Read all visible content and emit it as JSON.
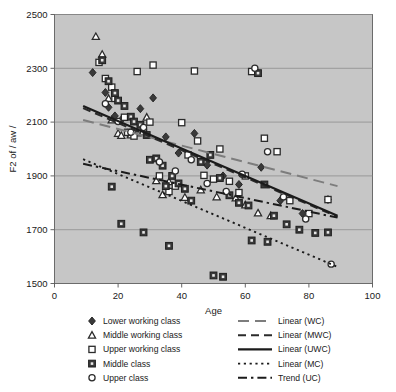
{
  "chart_data": {
    "type": "scatter",
    "title": "",
    "xlabel": "Age",
    "ylabel": "F2 of / aw /",
    "xlim": [
      0,
      100
    ],
    "ylim": [
      1500,
      2500
    ],
    "xticks": [
      0,
      20,
      40,
      60,
      80,
      100
    ],
    "yticks": [
      1500,
      1700,
      1900,
      2100,
      2300,
      2500
    ],
    "grid": "horizontal",
    "plot_background": "#c6c6c6",
    "legend_position": "below-axes",
    "series": [
      {
        "name": "Lower working class",
        "marker": "diamond",
        "points": [
          [
            12,
            2284
          ],
          [
            16,
            2210
          ],
          [
            17,
            2155
          ],
          [
            19,
            2123
          ],
          [
            21,
            2108
          ],
          [
            23,
            2060
          ],
          [
            27,
            2150
          ],
          [
            31,
            2190
          ],
          [
            35,
            2045
          ],
          [
            39,
            1985
          ],
          [
            44,
            2058
          ],
          [
            48,
            1940
          ],
          [
            53,
            1900
          ],
          [
            58,
            1868
          ],
          [
            63,
            2295
          ],
          [
            65,
            1932
          ],
          [
            71,
            1808
          ],
          [
            78,
            1760
          ],
          [
            86,
            1812
          ]
        ]
      },
      {
        "name": "Middle working class",
        "marker": "triangle",
        "points": [
          [
            13,
            2418
          ],
          [
            15,
            2352
          ],
          [
            17,
            2188
          ],
          [
            18,
            2108
          ],
          [
            20,
            2058
          ],
          [
            21,
            2050
          ],
          [
            24,
            2052
          ],
          [
            26,
            2060
          ],
          [
            29,
            2118
          ],
          [
            32,
            1882
          ],
          [
            34,
            1830
          ],
          [
            36,
            1878
          ],
          [
            41,
            1820
          ],
          [
            46,
            1848
          ],
          [
            51,
            1822
          ],
          [
            57,
            1818
          ],
          [
            60,
            1792
          ],
          [
            64,
            1762
          ],
          [
            68,
            1752
          ]
        ]
      },
      {
        "name": "Upper working class",
        "marker": "square-open",
        "points": [
          [
            14,
            2322
          ],
          [
            16,
            2262
          ],
          [
            18,
            2230
          ],
          [
            19,
            2188
          ],
          [
            22,
            2118
          ],
          [
            23,
            2062
          ],
          [
            25,
            2048
          ],
          [
            28,
            2062
          ],
          [
            30,
            2100
          ],
          [
            33,
            1900
          ],
          [
            36,
            1842
          ],
          [
            38,
            1862
          ],
          [
            40,
            2098
          ],
          [
            42,
            1978
          ],
          [
            45,
            2030
          ],
          [
            47,
            1902
          ],
          [
            50,
            1888
          ],
          [
            52,
            2000
          ],
          [
            55,
            1880
          ],
          [
            58,
            1838
          ],
          [
            60,
            1900
          ],
          [
            62,
            2288
          ],
          [
            66,
            2040
          ],
          [
            70,
            1990
          ],
          [
            74,
            1808
          ],
          [
            80,
            1760
          ],
          [
            86,
            1812
          ],
          [
            44,
            2290
          ],
          [
            31,
            2312
          ],
          [
            26,
            2288
          ]
        ]
      },
      {
        "name": "Middle class",
        "marker": "square-filled",
        "points": [
          [
            15,
            2330
          ],
          [
            17,
            2252
          ],
          [
            19,
            2208
          ],
          [
            20,
            2180
          ],
          [
            22,
            2160
          ],
          [
            24,
            2120
          ],
          [
            25,
            2102
          ],
          [
            27,
            2090
          ],
          [
            29,
            2052
          ],
          [
            30,
            1960
          ],
          [
            32,
            1965
          ],
          [
            34,
            1938
          ],
          [
            35,
            1862
          ],
          [
            37,
            1900
          ],
          [
            39,
            1872
          ],
          [
            41,
            1852
          ],
          [
            43,
            1808
          ],
          [
            46,
            1952
          ],
          [
            49,
            1978
          ],
          [
            52,
            1892
          ],
          [
            55,
            1828
          ],
          [
            58,
            1800
          ],
          [
            61,
            1790
          ],
          [
            64,
            2282
          ],
          [
            66,
            1868
          ],
          [
            69,
            1752
          ],
          [
            73,
            1720
          ],
          [
            77,
            1700
          ],
          [
            82,
            1688
          ],
          [
            86,
            1690
          ],
          [
            18,
            1860
          ],
          [
            21,
            1722
          ],
          [
            28,
            1690
          ],
          [
            36,
            1640
          ],
          [
            50,
            1530
          ],
          [
            53,
            1525
          ],
          [
            62,
            1660
          ],
          [
            67,
            1655
          ]
        ]
      },
      {
        "name": "Upper class",
        "marker": "circle-open",
        "points": [
          [
            16,
            2168
          ],
          [
            20,
            2102
          ],
          [
            24,
            2062
          ],
          [
            28,
            2080
          ],
          [
            33,
            1952
          ],
          [
            38,
            1918
          ],
          [
            43,
            1960
          ],
          [
            48,
            1872
          ],
          [
            54,
            1842
          ],
          [
            59,
            1906
          ],
          [
            63,
            2300
          ],
          [
            67,
            1990
          ],
          [
            72,
            1822
          ],
          [
            79,
            1740
          ],
          [
            87,
            1572
          ]
        ]
      }
    ],
    "trendlines": [
      {
        "name": "Linear (WC)",
        "style": "dashed-long",
        "x0": 9,
        "y0": 2108,
        "x1": 89,
        "y1": 1862
      },
      {
        "name": "Linear (MWC)",
        "style": "dashed-medium",
        "x0": 9,
        "y0": 2152,
        "x1": 89,
        "y1": 1748
      },
      {
        "name": "Linear (UWC)",
        "style": "solid",
        "x0": 9,
        "y0": 2160,
        "x1": 89,
        "y1": 1752
      },
      {
        "name": "Linear (MC)",
        "style": "dotted",
        "x0": 9,
        "y0": 1962,
        "x1": 89,
        "y1": 1562
      },
      {
        "name": "Trend (UC)",
        "style": "dash-dot",
        "x0": 9,
        "y0": 1945,
        "x1": 89,
        "y1": 1745
      }
    ],
    "legend_markers": [
      {
        "label": "Lower working class",
        "marker": "diamond"
      },
      {
        "label": "Middle working class",
        "marker": "triangle"
      },
      {
        "label": "Upper working class",
        "marker": "square-open"
      },
      {
        "label": "Middle class",
        "marker": "square-filled"
      },
      {
        "label": "Upper class",
        "marker": "circle-open"
      }
    ],
    "legend_lines": [
      {
        "label": "Linear (WC)",
        "style": "dashed-long"
      },
      {
        "label": "Linear (MWC)",
        "style": "dashed-medium"
      },
      {
        "label": "Linear (UWC)",
        "style": "solid"
      },
      {
        "label": "Linear (MC)",
        "style": "dotted"
      },
      {
        "label": "Trend (UC)",
        "style": "dash-dot"
      }
    ]
  }
}
